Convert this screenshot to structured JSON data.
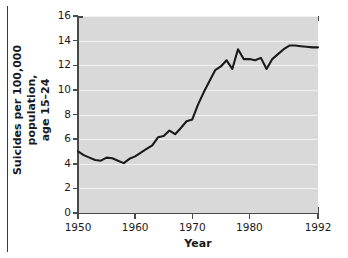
{
  "figure": {
    "background_color": "#ffffff",
    "panel_color": "#d9d9d9",
    "gridline_color": "#f2f2f2",
    "axis_color": "#4a4a4a",
    "series_color": "#1a1a1a",
    "rule_color": "#3a3a3a"
  },
  "ylabel_line1": "Suicides per 100,000 population,",
  "ylabel_line2": "age 15–24",
  "xlabel": "Year",
  "chart_data": {
    "type": "line",
    "title": "",
    "subtitle": "",
    "xlabel": "Year",
    "ylabel": "Suicides per 100,000 population, age 15–24",
    "xlim": [
      1950,
      1992
    ],
    "ylim": [
      0,
      16
    ],
    "xticks": [
      1950,
      1960,
      1970,
      1980,
      1992
    ],
    "xtick_labels": [
      "1950",
      "1960",
      "1970",
      "1980",
      "1992"
    ],
    "yticks": [
      0,
      2,
      4,
      6,
      8,
      10,
      12,
      14,
      16
    ],
    "ytick_labels": [
      "0",
      "2",
      "4",
      "6",
      "8",
      "10",
      "12",
      "14",
      "16"
    ],
    "grid": true,
    "grid_axis": "y",
    "legend": false,
    "legend_position": "none",
    "x": [
      1950,
      1951,
      1952,
      1953,
      1954,
      1955,
      1956,
      1957,
      1958,
      1959,
      1960,
      1961,
      1962,
      1963,
      1964,
      1965,
      1966,
      1967,
      1968,
      1969,
      1970,
      1971,
      1972,
      1973,
      1974,
      1975,
      1976,
      1977,
      1978,
      1979,
      1980,
      1981,
      1982,
      1983,
      1984,
      1985,
      1986,
      1987,
      1988,
      1989,
      1990,
      1991,
      1992
    ],
    "y": [
      5.0,
      4.7,
      4.5,
      4.3,
      4.25,
      4.5,
      4.45,
      4.25,
      4.05,
      4.4,
      4.6,
      4.9,
      5.2,
      5.5,
      6.15,
      6.25,
      6.7,
      6.4,
      6.9,
      7.45,
      7.6,
      8.8,
      9.8,
      10.7,
      11.6,
      11.9,
      12.4,
      11.7,
      13.3,
      12.5,
      12.5,
      12.4,
      12.6,
      11.7,
      12.5,
      12.9,
      13.3,
      13.6,
      13.6,
      13.55,
      13.5,
      13.45,
      13.45
    ],
    "series": [
      {
        "name": "Suicide rate, age 15–24",
        "values": [
          5.0,
          4.7,
          4.5,
          4.3,
          4.25,
          4.5,
          4.45,
          4.25,
          4.05,
          4.4,
          4.6,
          4.9,
          5.2,
          5.5,
          6.15,
          6.25,
          6.7,
          6.4,
          6.9,
          7.45,
          7.6,
          8.8,
          9.8,
          10.7,
          11.6,
          11.9,
          12.4,
          11.7,
          13.3,
          12.5,
          12.5,
          12.4,
          12.6,
          11.7,
          12.5,
          12.9,
          13.3,
          13.6,
          13.6,
          13.55,
          13.5,
          13.45,
          13.45
        ]
      }
    ]
  }
}
